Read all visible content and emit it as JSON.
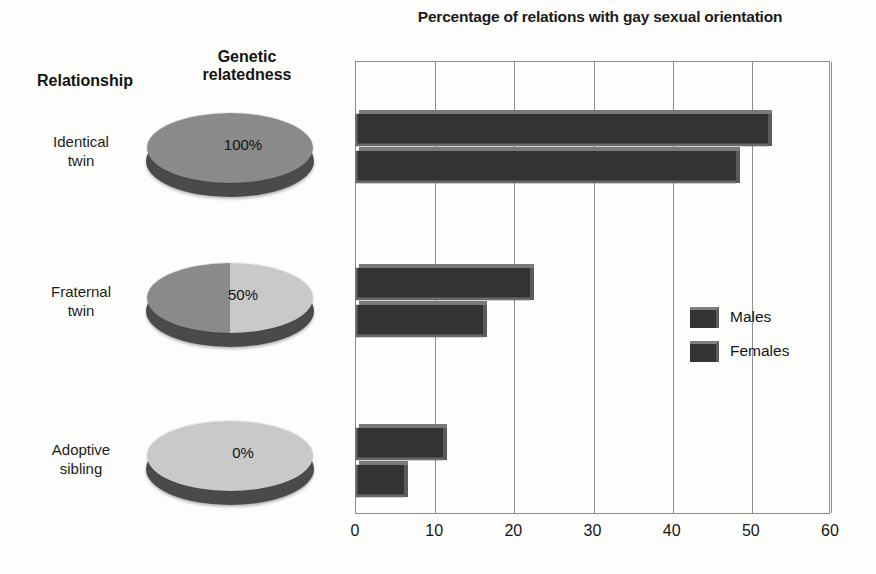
{
  "chart_data": {
    "type": "bar",
    "orientation": "horizontal",
    "title": "Percentage of relations with gay sexual orientation",
    "xlabel": "",
    "ylabel": "",
    "xlim": [
      0,
      60
    ],
    "xticks": [
      0,
      10,
      20,
      30,
      40,
      50,
      60
    ],
    "grid": true,
    "legend_position": "right-middle",
    "categories": [
      "Identical twin",
      "Fraternal twin",
      "Adoptive sibling"
    ],
    "series": [
      {
        "name": "Males",
        "values": [
          52,
          22,
          11
        ],
        "color": "#333333"
      },
      {
        "name": "Females",
        "values": [
          48,
          16,
          6
        ],
        "color": "#333333"
      }
    ]
  },
  "table": {
    "headers": {
      "relationship": "Relationship",
      "genetic": "Genetic\nrelatedness"
    },
    "header_relationship": "Relationship",
    "header_genetic_line1": "Genetic",
    "header_genetic_line2": "relatedness",
    "rows": [
      {
        "label_line1": "Identical",
        "label_line2": "twin",
        "relatedness": "100%",
        "shaded_fraction": 1.0
      },
      {
        "label_line1": "Fraternal",
        "label_line2": "twin",
        "relatedness": "50%",
        "shaded_fraction": 0.5
      },
      {
        "label_line1": "Adoptive",
        "label_line2": "sibling",
        "relatedness": "0%",
        "shaded_fraction": 0.0
      }
    ]
  },
  "legend": {
    "items": [
      {
        "label": "Males"
      },
      {
        "label": "Females"
      }
    ]
  },
  "axis": {
    "tick_labels": [
      "0",
      "10",
      "20",
      "30",
      "40",
      "50",
      "60"
    ]
  },
  "colors": {
    "bar": "#333333",
    "bar_top_highlight": "#7a7a7a",
    "pie_dark": "#8a8a8a",
    "pie_light": "#c9c9c9",
    "pie_side": "#4a4a4a",
    "axis": "#8d8d8d",
    "background": "#fdfdfc",
    "text": "#1a1a1a"
  }
}
